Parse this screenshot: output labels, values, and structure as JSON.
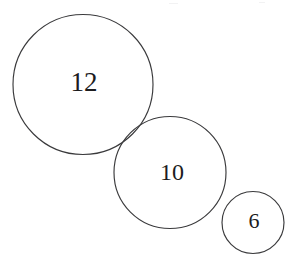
{
  "diagram": {
    "type": "geometry-diagram",
    "width": 291,
    "height": 256,
    "background_color": "#ffffff",
    "stroke_color": "#3a3a3c",
    "stroke_width": 1.15,
    "label_color": "#1c1c1e",
    "circles": [
      {
        "name": "large-circle",
        "label": "12",
        "cx": 83,
        "cy": 84.5,
        "r": 70,
        "label_x": 84,
        "label_y": 85,
        "label_font_size": 27
      },
      {
        "name": "medium-circle",
        "label": "10",
        "cx": 170,
        "cy": 172.5,
        "r": 56,
        "label_x": 172,
        "label_y": 174,
        "label_font_size": 24
      },
      {
        "name": "small-circle",
        "label": "6",
        "cx": 253,
        "cy": 222.5,
        "r": 31,
        "label_x": 254,
        "label_y": 223,
        "label_font_size": 22
      }
    ],
    "artifacts": [
      {
        "name": "top-speck-left",
        "x": 169,
        "y": 3,
        "width": 9
      },
      {
        "name": "top-speck-right",
        "x": 259,
        "y": 2,
        "width": 6
      }
    ]
  }
}
